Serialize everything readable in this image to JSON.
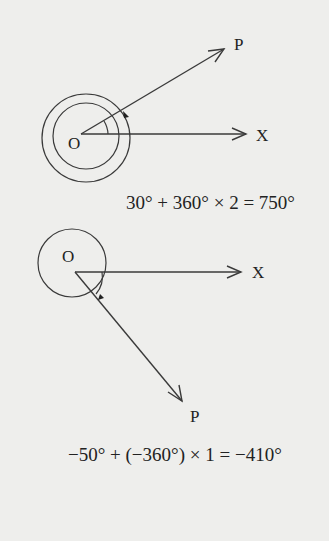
{
  "diagram1": {
    "label_origin": "O",
    "label_x": "X",
    "label_p": "P",
    "equation": "30° + 360° × 2 = 750°"
  },
  "diagram2": {
    "label_origin": "O",
    "label_x": "X",
    "label_p": "P",
    "equation": "−50° + (−360°) × 1 = −410°"
  },
  "colors": {
    "background": "#eeeeec",
    "stroke": "#3a3a3a",
    "text": "#222222"
  }
}
